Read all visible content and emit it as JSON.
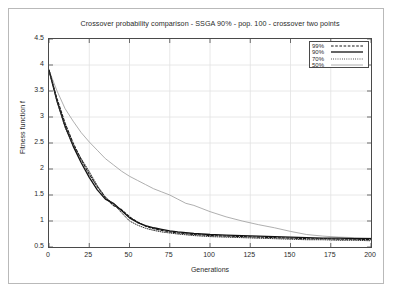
{
  "chart_data": {
    "type": "line",
    "title": "Crossover probability comparison - SSGA 90% - pop. 100 - crossover two points",
    "xlabel": "Generations",
    "ylabel": "Fitness function f",
    "xlim": [
      0,
      200
    ],
    "ylim": [
      0.5,
      4.5
    ],
    "xticks": [
      0,
      25,
      50,
      75,
      100,
      125,
      150,
      175,
      200
    ],
    "xtick_labels": [
      "0",
      "25",
      "50",
      "75",
      "100",
      "125",
      "150",
      "175",
      "200"
    ],
    "yticks": [
      0.5,
      1,
      1.5,
      2,
      2.5,
      3,
      3.5,
      4,
      4.5
    ],
    "ytick_labels": [
      "0.5",
      "1",
      "1.5",
      "2",
      "2.5",
      "3",
      "3.5",
      "4",
      "4.5"
    ],
    "grid": true,
    "legend_position": "top-right",
    "series": [
      {
        "name": "99%",
        "style": "dashed",
        "color": "#1a1a1a",
        "x": [
          0,
          5,
          10,
          15,
          20,
          25,
          30,
          35,
          40,
          45,
          50,
          55,
          60,
          65,
          70,
          75,
          80,
          90,
          100,
          110,
          120,
          130,
          140,
          150,
          160,
          170,
          180,
          190,
          200
        ],
        "values": [
          3.9,
          3.35,
          2.88,
          2.5,
          2.18,
          1.9,
          1.66,
          1.45,
          1.3,
          1.22,
          1.08,
          0.98,
          0.9,
          0.85,
          0.82,
          0.79,
          0.77,
          0.74,
          0.72,
          0.71,
          0.7,
          0.69,
          0.68,
          0.67,
          0.66,
          0.66,
          0.65,
          0.65,
          0.64
        ]
      },
      {
        "name": "90%",
        "style": "solid",
        "color": "#111111",
        "x": [
          0,
          5,
          10,
          15,
          20,
          25,
          30,
          35,
          40,
          45,
          50,
          55,
          60,
          65,
          70,
          75,
          80,
          90,
          100,
          110,
          120,
          130,
          140,
          150,
          160,
          170,
          180,
          190,
          200
        ],
        "values": [
          3.9,
          3.3,
          2.82,
          2.44,
          2.12,
          1.84,
          1.6,
          1.42,
          1.34,
          1.2,
          1.06,
          0.97,
          0.91,
          0.87,
          0.84,
          0.81,
          0.79,
          0.76,
          0.74,
          0.73,
          0.72,
          0.71,
          0.7,
          0.69,
          0.68,
          0.67,
          0.67,
          0.66,
          0.66
        ]
      },
      {
        "name": "70%",
        "style": "dotted",
        "color": "#303030",
        "x": [
          0,
          5,
          10,
          15,
          20,
          25,
          30,
          35,
          40,
          45,
          50,
          55,
          60,
          65,
          70,
          75,
          80,
          90,
          100,
          110,
          120,
          130,
          140,
          150,
          160,
          170,
          180,
          190,
          200
        ],
        "values": [
          3.9,
          3.3,
          2.8,
          2.45,
          2.2,
          1.95,
          1.68,
          1.46,
          1.33,
          1.16,
          1.0,
          0.92,
          0.86,
          0.82,
          0.79,
          0.77,
          0.75,
          0.72,
          0.7,
          0.69,
          0.68,
          0.67,
          0.66,
          0.65,
          0.64,
          0.64,
          0.63,
          0.63,
          0.62
        ]
      },
      {
        "name": "50%",
        "style": "solid-thin",
        "color": "#9a9a9a",
        "x": [
          0,
          5,
          10,
          15,
          20,
          25,
          30,
          35,
          40,
          45,
          50,
          55,
          60,
          65,
          70,
          75,
          80,
          85,
          90,
          95,
          100,
          110,
          120,
          130,
          140,
          150,
          160,
          170,
          180,
          190,
          200
        ],
        "values": [
          3.9,
          3.5,
          3.16,
          2.92,
          2.7,
          2.52,
          2.36,
          2.2,
          2.08,
          1.96,
          1.86,
          1.78,
          1.7,
          1.62,
          1.56,
          1.5,
          1.42,
          1.34,
          1.3,
          1.24,
          1.18,
          1.08,
          1.0,
          0.93,
          0.87,
          0.8,
          0.74,
          0.71,
          0.69,
          0.68,
          0.67
        ]
      }
    ]
  }
}
